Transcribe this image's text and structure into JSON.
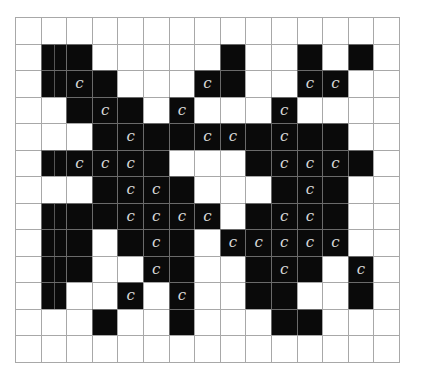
{
  "grid": {
    "rows": 13,
    "cols": 15,
    "colors": {
      "filled": "#0a0a0a",
      "empty": "#ffffff",
      "gridline": "#a8a8a8",
      "label": "#d8d8d8"
    },
    "label_glyph": "c",
    "legend": "B = filled black cell, C = filled black cell labeled 'c', . = empty white cell",
    "cells": [
      "...............",
      ".BB.....B..B.B.",
      ".BCB...CB..CC..",
      "..BCB.C...C....",
      "...BCBBCCBCBB..",
      ".BCCCB...BCCCB.",
      "...BCCB...BCB..",
      ".BBBCCCC.BCCB..",
      ".BB.BCB.CCCCC..",
      ".BB..CB..BCB.C.",
      ".B..C.C..BB..B.",
      "...B..B...BB...",
      "..............."
    ]
  }
}
